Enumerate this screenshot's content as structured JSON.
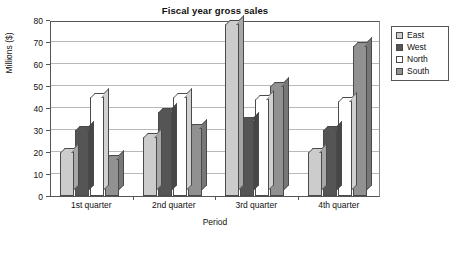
{
  "chart_data": {
    "type": "bar",
    "title": "Fiscal year gross sales",
    "xlabel": "Period",
    "ylabel": "Millions ($)",
    "categories": [
      "1st quarter",
      "2nd quarter",
      "3rd quarter",
      "4th quarter"
    ],
    "series": [
      {
        "name": "East",
        "color": "#cccccc",
        "values": [
          20,
          27,
          78,
          20
        ]
      },
      {
        "name": "West",
        "color": "#555555",
        "values": [
          30,
          38,
          34,
          30
        ]
      },
      {
        "name": "North",
        "color": "#ffffff",
        "values": [
          45,
          45,
          44,
          43
        ]
      },
      {
        "name": "South",
        "color": "#919191",
        "values": [
          17,
          31,
          50,
          68
        ]
      }
    ],
    "ylim": [
      0,
      80
    ],
    "yticks": [
      0,
      10,
      20,
      30,
      40,
      50,
      60,
      70,
      80
    ],
    "ytick_labels": [
      "0",
      "10",
      "20",
      "30",
      "40",
      "50",
      "60",
      "70",
      "80"
    ],
    "grid": true,
    "legend_position": "right",
    "legend_entries": [
      "East",
      "West",
      "North",
      "South"
    ]
  }
}
